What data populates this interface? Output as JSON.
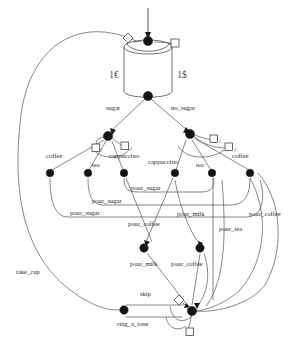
{
  "diagram": {
    "colors": {
      "edge": "#555555",
      "node": "#151515",
      "glyph_fill": "#ffffff",
      "glyph_stroke": "#3a3a3a",
      "background": "#ffffff"
    },
    "place": {
      "name": "coin-place-cylinder",
      "left_label": "1€",
      "right_label": "1$"
    },
    "edge_labels": [
      {
        "id": "sugar",
        "text": "sugar",
        "x": 106,
        "y": 110
      },
      {
        "id": "no_sugar",
        "text": "no_sugar",
        "x": 171,
        "y": 110
      },
      {
        "id": "coffee_left",
        "text": "coffee",
        "x": 46,
        "y": 158
      },
      {
        "id": "tea_left",
        "text": "tea",
        "x": 92,
        "y": 167
      },
      {
        "id": "cappuccino_l",
        "text": "cappuccino",
        "x": 109,
        "y": 158
      },
      {
        "id": "cappuccino_r",
        "text": "cappuccino",
        "x": 148,
        "y": 164
      },
      {
        "id": "tea_right",
        "text": "tea",
        "x": 196,
        "y": 167
      },
      {
        "id": "coffee_right",
        "text": "coffee",
        "x": 232,
        "y": 158
      },
      {
        "id": "pour_sugar_1",
        "text": "pour_sugar",
        "x": 131,
        "y": 190
      },
      {
        "id": "pour_sugar_2",
        "text": "pour_sugar",
        "x": 92,
        "y": 203
      },
      {
        "id": "pour_sugar_3",
        "text": "pour_sugar",
        "x": 70,
        "y": 215
      },
      {
        "id": "pour_milk_1",
        "text": "pour_milk",
        "x": 177,
        "y": 216
      },
      {
        "id": "pour_coffee_1",
        "text": "pour_coffee",
        "x": 128,
        "y": 226
      },
      {
        "id": "pour_coffee_2",
        "text": "pour_coffee",
        "x": 249,
        "y": 216
      },
      {
        "id": "pour_tea_1",
        "text": "pour_tea",
        "x": 219,
        "y": 231
      },
      {
        "id": "pour_milk_2",
        "text": "pour_milk",
        "x": 130,
        "y": 266
      },
      {
        "id": "pour_coffee_3",
        "text": "pour_coffee",
        "x": 171,
        "y": 266
      },
      {
        "id": "take_cup",
        "text": "take_cup",
        "x": 16,
        "y": 274
      },
      {
        "id": "skip",
        "text": "skip",
        "x": 140,
        "y": 296
      },
      {
        "id": "ring_a_tone",
        "text": "ring_a_tone",
        "x": 117,
        "y": 326
      }
    ],
    "subscript_labels": [
      {
        "id": "sub-left-1",
        "text": "1",
        "x": 100,
        "y": 150
      },
      {
        "id": "sub-left-2",
        "text": "2",
        "x": 130,
        "y": 148
      },
      {
        "id": "sub-right-1",
        "text": "1",
        "x": 219,
        "y": 141
      },
      {
        "id": "sub-right-2",
        "text": "2",
        "x": 234,
        "y": 149
      }
    ],
    "nodes": [
      {
        "id": "node-entry",
        "x": 148,
        "y": 41
      },
      {
        "id": "node-dispatch",
        "x": 148,
        "y": 96
      },
      {
        "id": "node-sugar",
        "x": 108,
        "y": 136
      },
      {
        "id": "node-no-sugar",
        "x": 190,
        "y": 134
      },
      {
        "id": "node-coffee-l",
        "x": 50,
        "y": 173
      },
      {
        "id": "node-tea-l",
        "x": 88,
        "y": 173
      },
      {
        "id": "node-capp-l",
        "x": 124,
        "y": 173
      },
      {
        "id": "node-capp-r",
        "x": 175,
        "y": 173
      },
      {
        "id": "node-tea-r",
        "x": 212,
        "y": 173
      },
      {
        "id": "node-coffee-r",
        "x": 250,
        "y": 173
      },
      {
        "id": "node-milk",
        "x": 144,
        "y": 248
      },
      {
        "id": "node-coffee-mid",
        "x": 200,
        "y": 248
      },
      {
        "id": "node-cup-left",
        "x": 124,
        "y": 310
      },
      {
        "id": "node-final",
        "x": 192,
        "y": 311
      }
    ],
    "glyphs": [
      {
        "id": "glyph-top-diamond",
        "shape": "diamond",
        "x": 128,
        "y": 38
      },
      {
        "id": "glyph-top-square",
        "shape": "square",
        "x": 175,
        "y": 43
      },
      {
        "id": "glyph-left-sq-1",
        "shape": "square",
        "x": 96,
        "y": 148
      },
      {
        "id": "glyph-left-sq-2",
        "shape": "square",
        "x": 125,
        "y": 146
      },
      {
        "id": "glyph-right-sq-1",
        "shape": "square",
        "x": 214,
        "y": 139
      },
      {
        "id": "glyph-right-sq-2",
        "shape": "square",
        "x": 229,
        "y": 147
      },
      {
        "id": "glyph-bot-diamond",
        "shape": "diamond",
        "x": 179,
        "y": 300
      },
      {
        "id": "glyph-bot-square",
        "shape": "square",
        "x": 190,
        "y": 332
      }
    ]
  }
}
